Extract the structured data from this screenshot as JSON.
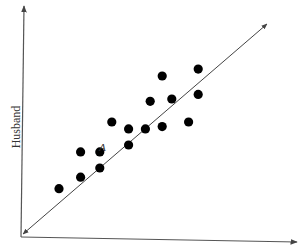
{
  "chart_data": {
    "type": "scatter",
    "title": "",
    "xlabel": "",
    "ylabel": "Husband",
    "grid": false,
    "legend": null,
    "axes": {
      "x_arrow": true,
      "y_arrow": true,
      "tick_labels": "none"
    },
    "reference_line": {
      "description": "diagonal line with arrowheads at both ends (y = x)",
      "from": [
        0,
        0
      ],
      "to": [
        1,
        1
      ]
    },
    "annotations": [
      {
        "text": "A",
        "x": 0.32,
        "y": 0.37,
        "point_index": 4
      }
    ],
    "points": [
      {
        "x": 0.15,
        "y": 0.21
      },
      {
        "x": 0.24,
        "y": 0.26
      },
      {
        "x": 0.24,
        "y": 0.37
      },
      {
        "x": 0.32,
        "y": 0.3
      },
      {
        "x": 0.32,
        "y": 0.37
      },
      {
        "x": 0.37,
        "y": 0.5
      },
      {
        "x": 0.44,
        "y": 0.47
      },
      {
        "x": 0.44,
        "y": 0.4
      },
      {
        "x": 0.53,
        "y": 0.59
      },
      {
        "x": 0.51,
        "y": 0.47
      },
      {
        "x": 0.58,
        "y": 0.7
      },
      {
        "x": 0.62,
        "y": 0.6
      },
      {
        "x": 0.58,
        "y": 0.48
      },
      {
        "x": 0.69,
        "y": 0.5
      },
      {
        "x": 0.73,
        "y": 0.73
      },
      {
        "x": 0.73,
        "y": 0.62
      }
    ]
  },
  "colors": {
    "axis": "#555555",
    "dot": "#000000",
    "text": "#333333",
    "background": "#ffffff"
  },
  "labels": {
    "ylabel": "Husband",
    "point_a": "A"
  }
}
